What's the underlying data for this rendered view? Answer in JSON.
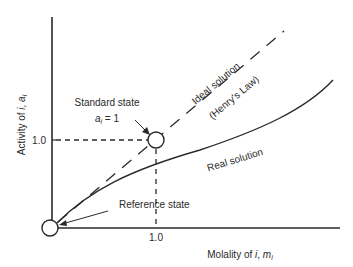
{
  "diagram": {
    "axes": {
      "x_label_prefix": "Molality of ",
      "x_label_var": "i",
      "x_label_sep": ", ",
      "x_label_sym": "m",
      "x_label_sub": "i",
      "y_label_prefix": "Activity of ",
      "y_label_var": "i",
      "y_label_sep": ", ",
      "y_label_sym": "a",
      "y_label_sub": "i",
      "x_tick": "1.0",
      "y_tick": "1.0"
    },
    "annotations": {
      "standard_state": "Standard state",
      "standard_state_eq_sym": "a",
      "standard_state_eq_sub": "i",
      "standard_state_eq_rhs": " = 1",
      "reference_state": "Reference state",
      "ideal_line_1": "Ideal solution",
      "ideal_line_2": "(Henry's Law)",
      "real_curve": "Real solution"
    },
    "colors": {
      "ink": "#2a2a2a",
      "background": "#ffffff"
    }
  }
}
